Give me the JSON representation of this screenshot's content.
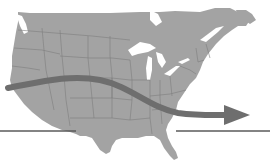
{
  "map": {
    "subject": "Continental United States with southern Canada",
    "style": "grayscale",
    "colors": {
      "background": "#ffffff",
      "land": "#a3a3a3",
      "borders": "#7d7d7d",
      "water": "#ffffff",
      "arrow": "#6e6e6e",
      "line": "#5a5a5a"
    },
    "overlays": [
      {
        "type": "arrow",
        "direction": "west-to-east",
        "description": "thick curved arrow crossing the country from the Pacific coast to the Atlantic, dipping through the south-central states"
      },
      {
        "type": "horizontal-line",
        "description": "thin horizontal reference line near the southern border, interrupted by Texas/Gulf landmass"
      }
    ],
    "labels": []
  }
}
